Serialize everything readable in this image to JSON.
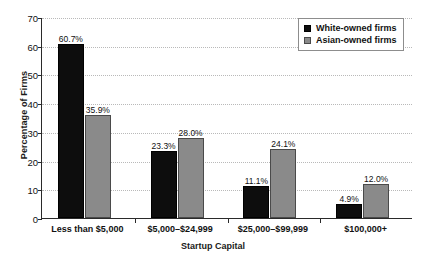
{
  "chart_data": {
    "type": "bar",
    "title": "",
    "subtitle": "",
    "xlabel": "Startup Capital",
    "ylabel": "Percentage of Firms",
    "categories": [
      "Less than $5,000",
      "$5,000–$24,999",
      "$25,000–$99,999",
      "$100,000+"
    ],
    "series": [
      {
        "name": "White-owned firms",
        "color": "#0d0d0d",
        "values": [
          60.7,
          23.3,
          11.1,
          4.9
        ],
        "labels": [
          "60.7%",
          "23.3%",
          "11.1%",
          "4.9%"
        ]
      },
      {
        "name": "Asian-owned firms",
        "color": "#8a8a8a",
        "values": [
          35.9,
          28.0,
          24.1,
          12.0
        ],
        "labels": [
          "35.9%",
          "28.0%",
          "24.1%",
          "12.0%"
        ]
      }
    ],
    "ylim": [
      0,
      70
    ],
    "yticks": [
      0,
      10,
      20,
      30,
      40,
      50,
      60,
      70
    ],
    "ytick_labels": [
      "0",
      "10",
      "20",
      "30",
      "40",
      "50",
      "60",
      "70"
    ],
    "grid": "horizontal-dotted",
    "legend_position": "top-right"
  },
  "legend": {
    "entries": [
      {
        "label": "White-owned firms",
        "swatch": "black-square-icon"
      },
      {
        "label": "Asian-owned firms",
        "swatch": "gray-square-icon"
      }
    ]
  }
}
